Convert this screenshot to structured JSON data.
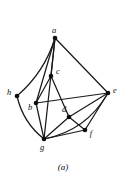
{
  "figure": {
    "caption": "(a)",
    "ink_color": "#1a1a1a",
    "background_color": "#ffffff"
  },
  "chart_data": {
    "type": "diagram",
    "subtype": "graph",
    "title": "(a)",
    "directed": false,
    "vertex_count": 8,
    "edge_count": 16,
    "nodes": [
      {
        "id": "a",
        "label": "a",
        "x": 55,
        "y": 38,
        "label_dx": -1,
        "label_dy": -7
      },
      {
        "id": "c",
        "label": "c",
        "x": 51,
        "y": 76,
        "label_dx": 7,
        "label_dy": -4
      },
      {
        "id": "h",
        "label": "h",
        "x": 17,
        "y": 96,
        "label_dx": -8,
        "label_dy": -3
      },
      {
        "id": "b",
        "label": "b",
        "x": 36,
        "y": 103,
        "label_dx": -6,
        "label_dy": 5
      },
      {
        "id": "e",
        "label": "e",
        "x": 108,
        "y": 93,
        "label_dx": 7,
        "label_dy": -2
      },
      {
        "id": "d",
        "label": "d",
        "x": 69,
        "y": 117,
        "label_dx": -5,
        "label_dy": -7
      },
      {
        "id": "f",
        "label": "f",
        "x": 85,
        "y": 130,
        "label_dx": 6,
        "label_dy": 4
      },
      {
        "id": "g",
        "label": "g",
        "x": 44,
        "y": 139,
        "label_dx": -2,
        "label_dy": 9
      }
    ],
    "edges": [
      {
        "from": "a",
        "to": "h",
        "shape": "curve",
        "bow": -10
      },
      {
        "from": "a",
        "to": "b",
        "shape": "line"
      },
      {
        "from": "a",
        "to": "c",
        "shape": "line"
      },
      {
        "from": "a",
        "to": "g",
        "shape": "line"
      },
      {
        "from": "a",
        "to": "e",
        "shape": "line"
      },
      {
        "from": "c",
        "to": "b",
        "shape": "line"
      },
      {
        "from": "c",
        "to": "d",
        "shape": "line"
      },
      {
        "from": "b",
        "to": "e",
        "shape": "line"
      },
      {
        "from": "b",
        "to": "g",
        "shape": "line"
      },
      {
        "from": "h",
        "to": "g",
        "shape": "curve",
        "bow": 9
      },
      {
        "from": "d",
        "to": "e",
        "shape": "line"
      },
      {
        "from": "d",
        "to": "g",
        "shape": "line"
      },
      {
        "from": "d",
        "to": "f",
        "shape": "line"
      },
      {
        "from": "f",
        "to": "e",
        "shape": "line"
      },
      {
        "from": "f",
        "to": "g",
        "shape": "line"
      },
      {
        "from": "g",
        "to": "e",
        "shape": "curve",
        "bow": 18
      }
    ],
    "caption_position": {
      "x": 63,
      "y": 170
    },
    "vertex_radius": 2.3,
    "edge_width": 1.25
  }
}
